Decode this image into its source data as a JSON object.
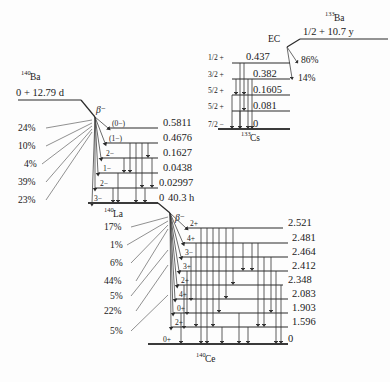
{
  "figure": {
    "background": "#ffffff",
    "line_color": "#2a2a2a"
  },
  "ba140": {
    "mass": "140",
    "symbol": "Ba",
    "head": "0 + 12.79 d",
    "decay_label": "β⁻",
    "branches": [
      "24%",
      "10%",
      "4%",
      "39%",
      "23%"
    ]
  },
  "la140": {
    "mass": "140",
    "symbol": "La",
    "decay_label": "β⁻",
    "ground_note": "40.3 h",
    "levels": [
      {
        "spin": "(0−)",
        "energy": "0.5811"
      },
      {
        "spin": "(1−)",
        "energy": "0.4676"
      },
      {
        "spin": "2−",
        "energy": "0.1627"
      },
      {
        "spin": "1−",
        "energy": "0.0438"
      },
      {
        "spin": "2−",
        "energy": "0.02997"
      },
      {
        "spin": "3−",
        "energy": "0"
      }
    ],
    "branches": [
      "17%",
      "1%",
      "6%",
      "44%",
      "5%",
      "22%",
      "5%"
    ]
  },
  "ce140": {
    "mass": "140",
    "symbol": "Ce",
    "levels": [
      {
        "spin": "2+",
        "energy": "2.521"
      },
      {
        "spin": "4+",
        "energy": "2.481"
      },
      {
        "spin": "3−",
        "energy": "2.464"
      },
      {
        "spin": "3+",
        "energy": "2.412"
      },
      {
        "spin": "2+",
        "energy": "2.348"
      },
      {
        "spin": "4+",
        "energy": "2.083"
      },
      {
        "spin": "0+",
        "energy": "1.903"
      },
      {
        "spin": "2+",
        "energy": "1.596"
      },
      {
        "spin": "0+",
        "energy": "0"
      }
    ]
  },
  "ba133": {
    "mass": "133",
    "symbol": "Ba",
    "head": "1/2 + 10.7 y",
    "decay_label": "EC",
    "branches": [
      "86%",
      "14%"
    ]
  },
  "cs133": {
    "mass": "133",
    "symbol": "Cs",
    "levels": [
      {
        "spin": "1/2 +",
        "energy": "0.437"
      },
      {
        "spin": "3/2 +",
        "energy": "0.382"
      },
      {
        "spin": "5/2 +",
        "energy": "0.1605"
      },
      {
        "spin": "5/2 +",
        "energy": "0.081"
      },
      {
        "spin": "7/2 −",
        "energy": "0"
      }
    ]
  }
}
